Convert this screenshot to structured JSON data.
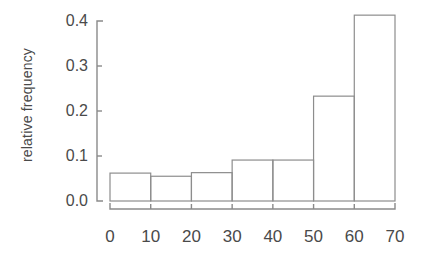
{
  "chart_data": {
    "type": "bar",
    "title": "",
    "subtitle": "",
    "xlabel": "",
    "ylabel": "relative frequency",
    "categories": [
      "0-10",
      "10-20",
      "20-30",
      "30-40",
      "40-50",
      "50-60",
      "60-70"
    ],
    "bin_edges": [
      0,
      10,
      20,
      30,
      40,
      50,
      60,
      70
    ],
    "values": [
      0.062,
      0.055,
      0.063,
      0.091,
      0.091,
      0.233,
      0.413
    ],
    "xlim": [
      0,
      70
    ],
    "ylim": [
      0.0,
      0.425
    ],
    "xticks": [
      0,
      10,
      20,
      30,
      40,
      50,
      60,
      70
    ],
    "xtick_labels": [
      "0",
      "10",
      "20",
      "30",
      "40",
      "50",
      "60",
      "70"
    ],
    "yticks": [
      0.0,
      0.1,
      0.2,
      0.3,
      0.4
    ],
    "ytick_labels": [
      "0.0",
      "0.1",
      "0.2",
      "0.3",
      "0.4"
    ],
    "grid": false,
    "legend": null,
    "annotations": [],
    "bar_fill": "#ffffff",
    "bar_edge_color": "#8d8d8d",
    "axis_color": "#8a8a8a",
    "background": "#ffffff"
  },
  "axes": {
    "ylabel_text": "relative frequency"
  }
}
